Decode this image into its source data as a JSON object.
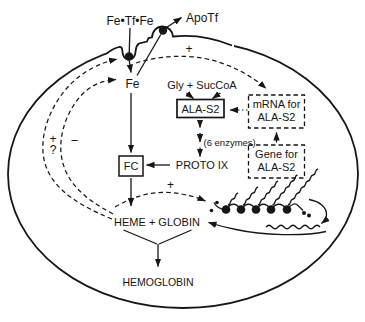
{
  "colors": {
    "ink": "#161616",
    "background": "#ffffff"
  },
  "membrane": {
    "holo_transferrin": "Fe•Tf•Fe",
    "apo_transferrin": "ApoTf"
  },
  "pathway": {
    "iron": "Fe",
    "precursors": "Gly + SucCoA",
    "ala_synthase": "ALA-S2",
    "enzyme_steps": "(6 enzymes)",
    "protoporphyrin": "PROTO IX",
    "ferrochelatase": "FC",
    "heme_globin": "HEME + GLOBIN",
    "hemoglobin": "HEMOGLOBIN"
  },
  "genetics": {
    "mrna_box_line1": "mRNA for",
    "mrna_box_line2": "ALA-S2",
    "gene_box_line1": "Gene for",
    "gene_box_line2": "ALA-S2"
  },
  "signs": {
    "iron_to_mrna": "+",
    "uptake_plus": "+",
    "uptake_query": "?",
    "iron_minus": "−",
    "translation_plus": "+"
  }
}
